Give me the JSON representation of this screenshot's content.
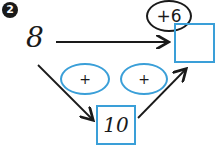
{
  "exercise": {
    "number": "2",
    "start_value": "8",
    "direct_operation": "+6",
    "result_value": "",
    "intermediate_value": "10",
    "step1_operation": "+",
    "step2_operation": "+"
  },
  "colors": {
    "ink": "#1a1a1a",
    "accent": "#3a9fd8"
  }
}
